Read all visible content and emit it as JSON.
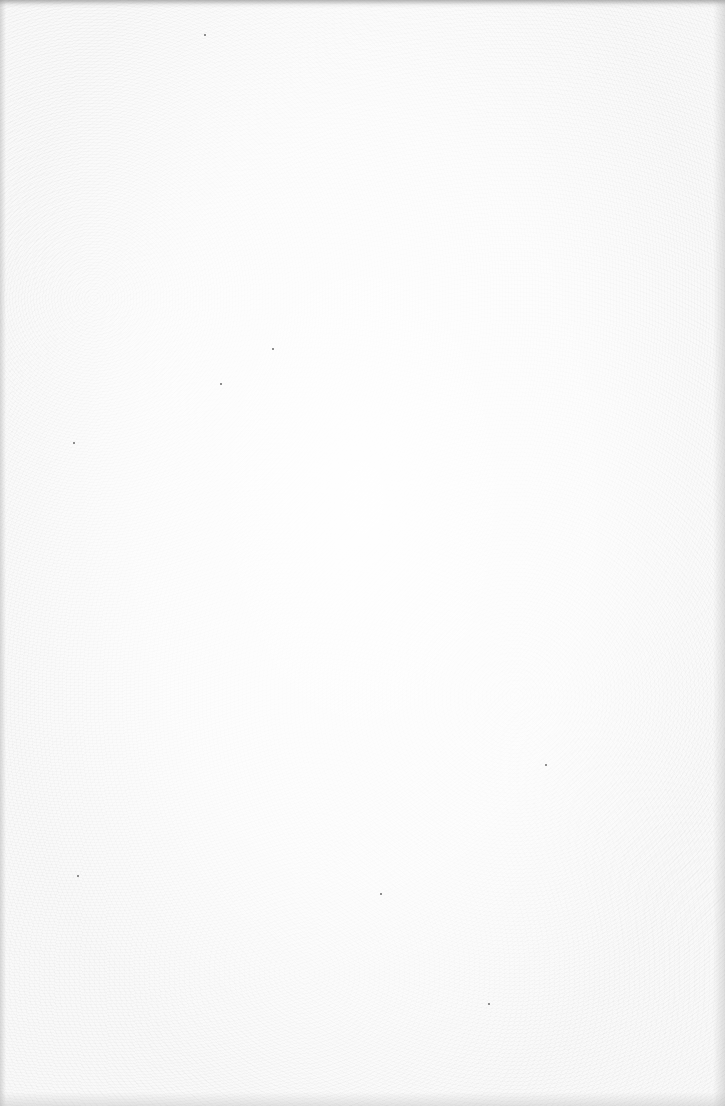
{
  "page": {
    "type": "blank-scanned-page",
    "content_text": "",
    "background_color": "#f9f9f9",
    "edge_shadow_color": "#8a8a8a"
  },
  "specks": [
    {
      "x": 272,
      "y": 348
    },
    {
      "x": 220,
      "y": 383
    },
    {
      "x": 73,
      "y": 442
    },
    {
      "x": 545,
      "y": 764
    },
    {
      "x": 77,
      "y": 875
    },
    {
      "x": 380,
      "y": 893
    },
    {
      "x": 204,
      "y": 34
    },
    {
      "x": 488,
      "y": 1003
    }
  ]
}
